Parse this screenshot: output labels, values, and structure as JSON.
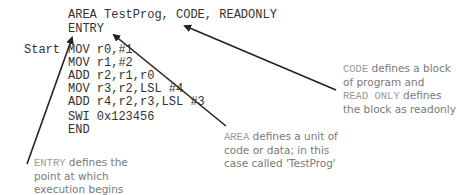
{
  "code": {
    "header_lines": [
      "AREA TestProg, CODE, READONLY",
      "ENTRY"
    ],
    "label": "Start",
    "body_lines": [
      "MOV r0,#1",
      "MOV r1,#2",
      "ADD r2,r1,r0",
      "MOV r3,r2,LSL #4",
      "ADD r4,r2,r3,LSL #3",
      "SWI 0x123456",
      "END"
    ]
  },
  "annotations": {
    "code_readonly": {
      "kw1": "CODE",
      "t1": " defines a block",
      "t2": "of program and",
      "kw2": "READ ONLY",
      "t3": " defines",
      "t4": "the block as readonly"
    },
    "area": {
      "kw": "AREA",
      "t1": " defines a unit of",
      "t2": "code or data; in this",
      "t3": "case called 'TestProg'"
    },
    "entry": {
      "kw": "ENTRY",
      "t1": " defines the",
      "t2": "point at which",
      "t3": "execution begins"
    }
  },
  "colors": {
    "code_text": "#333333",
    "note_text": "#7a7a7a",
    "arrow": "#222222"
  }
}
